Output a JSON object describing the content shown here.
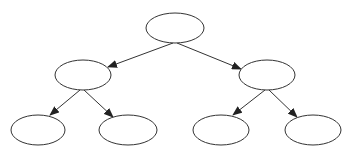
{
  "diagram": {
    "type": "binary-tree",
    "stroke_color": "#333333",
    "background": "#ffffff",
    "nodes": [
      {
        "id": "root",
        "cx": 175,
        "cy": 28,
        "rx": 29,
        "ry": 15,
        "label": ""
      },
      {
        "id": "left",
        "cx": 83,
        "cy": 75,
        "rx": 28,
        "ry": 15,
        "label": ""
      },
      {
        "id": "right",
        "cx": 267,
        "cy": 75,
        "rx": 28,
        "ry": 15,
        "label": ""
      },
      {
        "id": "left-left",
        "cx": 38,
        "cy": 130,
        "rx": 27,
        "ry": 15,
        "label": ""
      },
      {
        "id": "left-right",
        "cx": 128,
        "cy": 130,
        "rx": 29,
        "ry": 15,
        "label": ""
      },
      {
        "id": "right-left",
        "cx": 221,
        "cy": 130,
        "rx": 28,
        "ry": 15,
        "label": ""
      },
      {
        "id": "right-right",
        "cx": 313,
        "cy": 130,
        "rx": 28,
        "ry": 15,
        "label": ""
      }
    ],
    "edges": [
      {
        "from": "root",
        "to": "left",
        "x1": 173,
        "y1": 43,
        "x2": 108,
        "y2": 67
      },
      {
        "from": "root",
        "to": "right",
        "x1": 177,
        "y1": 43,
        "x2": 241,
        "y2": 69
      },
      {
        "from": "left",
        "to": "left-left",
        "x1": 80,
        "y1": 90,
        "x2": 50,
        "y2": 115
      },
      {
        "from": "left",
        "to": "left-right",
        "x1": 84,
        "y1": 90,
        "x2": 113,
        "y2": 117
      },
      {
        "from": "right",
        "to": "right-left",
        "x1": 265,
        "y1": 90,
        "x2": 233,
        "y2": 115
      },
      {
        "from": "right",
        "to": "right-right",
        "x1": 269,
        "y1": 90,
        "x2": 297,
        "y2": 117
      }
    ]
  }
}
